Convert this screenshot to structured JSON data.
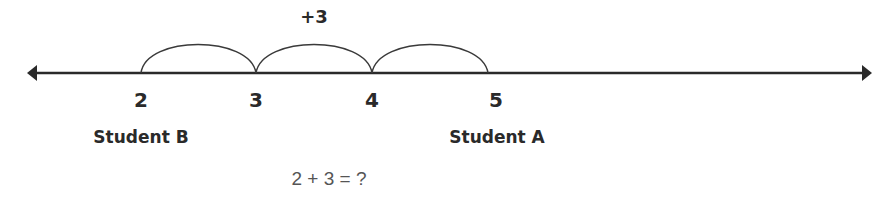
{
  "diagram": {
    "type": "number-line",
    "jump_label": "+3",
    "ticks": [
      {
        "value": "2",
        "x": 141
      },
      {
        "value": "3",
        "x": 256
      },
      {
        "value": "4",
        "x": 372
      },
      {
        "value": "5",
        "x": 488
      }
    ],
    "students": {
      "b": {
        "label": "Student B",
        "at": "2"
      },
      "a": {
        "label": "Student A",
        "at": "5"
      }
    },
    "equation": "2 + 3 = ?",
    "colors": {
      "line": "#2a2a2a",
      "arc": "#3a3a3a",
      "equation": "#555555"
    }
  }
}
